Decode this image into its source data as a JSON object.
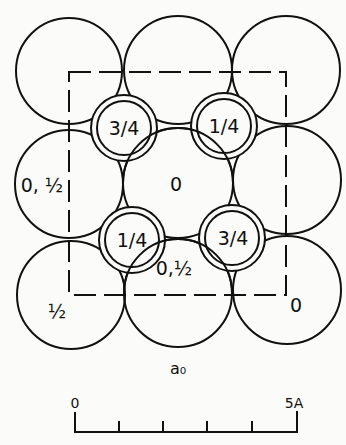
{
  "diagram": {
    "large_atoms": [
      {
        "cx": 69,
        "cy": 71,
        "label": ""
      },
      {
        "cx": 178,
        "cy": 70,
        "label": ""
      },
      {
        "cx": 286,
        "cy": 70,
        "label": ""
      },
      {
        "cx": 69,
        "cy": 184,
        "label": "0, ½"
      },
      {
        "cx": 178,
        "cy": 183,
        "label": "0"
      },
      {
        "cx": 287,
        "cy": 180,
        "label": ""
      },
      {
        "cx": 71,
        "cy": 295,
        "label": "½"
      },
      {
        "cx": 178,
        "cy": 293,
        "label": "0,½"
      },
      {
        "cx": 287,
        "cy": 290,
        "label": "0"
      }
    ],
    "small_atoms": [
      {
        "cx": 124,
        "cy": 128,
        "label": "3/4"
      },
      {
        "cx": 224,
        "cy": 126,
        "label": "1/4"
      },
      {
        "cx": 132,
        "cy": 240,
        "label": "1/4"
      },
      {
        "cx": 232,
        "cy": 238,
        "label": "3/4"
      }
    ],
    "unit_cell_label": "a₀",
    "scale_bar": {
      "start_label": "0",
      "end_label": "5A",
      "divisions": 5
    }
  }
}
